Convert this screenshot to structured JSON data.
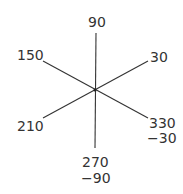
{
  "diagram": {
    "title": "",
    "center": {
      "x": 95,
      "y": 90
    },
    "rays": [
      {
        "angle": 90,
        "label": "90"
      },
      {
        "angle": 30,
        "label": "30"
      },
      {
        "angle": 150,
        "label": "150"
      },
      {
        "angle": 210,
        "label": "210"
      },
      {
        "angle": 270,
        "label": "270",
        "alt_label": "−90"
      },
      {
        "angle": 330,
        "label": "330",
        "alt_label": "−30"
      }
    ],
    "line_color": "#333333"
  }
}
